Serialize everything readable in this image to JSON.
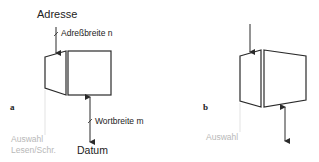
{
  "figure_a": {
    "label": "a",
    "address_label": "Adresse",
    "address_width_label": "Adreßbreite n",
    "word_width_label": "Wortbreite m",
    "data_label": "Datum",
    "select_label_line1": "Auswahl",
    "select_label_line2": "Lesen/Schr."
  },
  "figure_b": {
    "label": "b",
    "select_label": "Auswahl"
  },
  "colors": {
    "line": "#2a2a2a",
    "muted_text": "#b8b8b8",
    "text": "#222222"
  }
}
